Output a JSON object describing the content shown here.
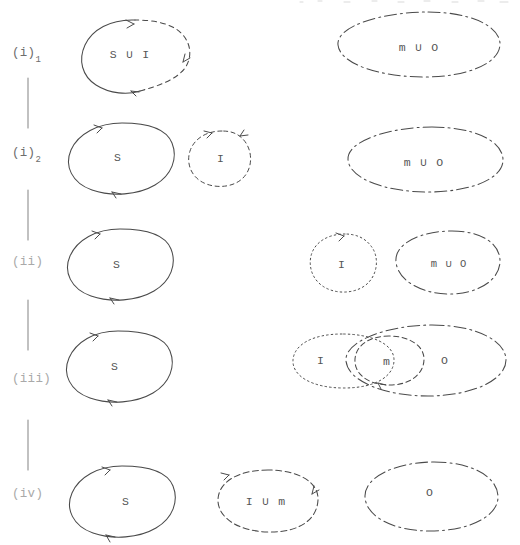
{
  "figure": {
    "kind": "hand-drawn-set-decomposition-diagram",
    "background_color": "#ffffff",
    "ink_color": "#444444",
    "rows": [
      {
        "id": "row-i-1",
        "label_main": "(i)",
        "label_sub": "1",
        "groups": [
          {
            "name": "S-union-I-blob",
            "text": "S ∪ I",
            "style": "solid-dashed-mixed"
          },
          {
            "name": "m-union-O-blob",
            "text": "m ∪ O",
            "style": "dash-dot"
          }
        ]
      },
      {
        "id": "row-i-2",
        "label_main": "(i)",
        "label_sub": "2",
        "groups": [
          {
            "name": "S-blob",
            "text": "S",
            "style": "solid"
          },
          {
            "name": "I-blob",
            "text": "I",
            "style": "dashed"
          },
          {
            "name": "m-union-O-blob",
            "text": "m ∪ O",
            "style": "dash-dot"
          }
        ]
      },
      {
        "id": "row-ii",
        "label_main": "(ii)",
        "label_sub": "",
        "groups": [
          {
            "name": "S-blob",
            "text": "S",
            "style": "solid"
          },
          {
            "name": "I-blob",
            "text": "I",
            "style": "dotted"
          },
          {
            "name": "m-union-O-blob",
            "text": "m ∪ O",
            "style": "dash-dot"
          }
        ]
      },
      {
        "id": "row-iii",
        "label_main": "(iii)",
        "label_sub": "",
        "groups": [
          {
            "name": "S-blob",
            "text": "S",
            "style": "solid"
          },
          {
            "name": "I-blob",
            "text": "I",
            "style": "dotted"
          },
          {
            "name": "m-blob",
            "text": "m",
            "style": "dashed"
          },
          {
            "name": "O-blob",
            "text": "O",
            "style": "dash-dot"
          }
        ]
      },
      {
        "id": "row-iv",
        "label_main": "(iv)",
        "label_sub": "",
        "groups": [
          {
            "name": "S-blob",
            "text": "S",
            "style": "solid"
          },
          {
            "name": "I-union-m-blob",
            "text": "I ∪ m",
            "style": "dashed"
          },
          {
            "name": "O-blob",
            "text": "O",
            "style": "dash-dot"
          }
        ]
      }
    ],
    "connectors": [
      {
        "name": "connector-i1-i2"
      },
      {
        "name": "connector-i2-ii"
      },
      {
        "name": "connector-ii-iii"
      },
      {
        "name": "connector-iii-iv"
      }
    ]
  }
}
